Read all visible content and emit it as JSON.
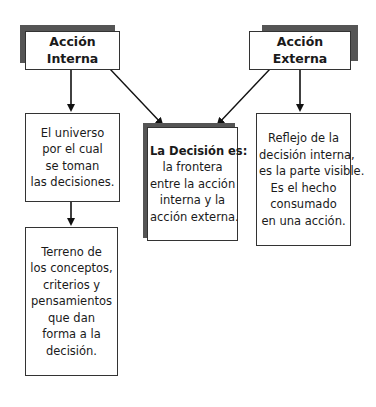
{
  "diagram": {
    "nodes": {
      "accion_interna": {
        "label": "Acción Interna"
      },
      "accion_externa": {
        "label": "Acción Externa"
      },
      "universo": {
        "lines": [
          "El universo",
          "por el cual",
          "se toman",
          "las decisiones."
        ]
      },
      "terreno": {
        "lines": [
          "Terreno de",
          "los conceptos,",
          "criterios y",
          "pensamientos",
          "que dan",
          "forma a la",
          "decisión."
        ]
      },
      "decision": {
        "title": "La Decisión es:",
        "lines": [
          "la frontera",
          "entre la acción",
          "interna y la",
          "acción externa."
        ]
      },
      "reflejo": {
        "lines": [
          "Reflejo de la",
          "decisión interna,",
          "es la parte visible.",
          "Es el hecho",
          "consumado",
          "en una acción."
        ]
      }
    },
    "edges": [
      {
        "from": "Acción Interna",
        "to": "El universo..."
      },
      {
        "from": "El universo...",
        "to": "Terreno de..."
      },
      {
        "from": "Acción Interna",
        "to": "La Decisión es:"
      },
      {
        "from": "Acción Externa",
        "to": "La Decisión es:"
      },
      {
        "from": "Acción Externa",
        "to": "Reflejo de la..."
      }
    ],
    "colors": {
      "shadow": "#555555",
      "border": "#333333",
      "arrow": "#111111"
    }
  }
}
